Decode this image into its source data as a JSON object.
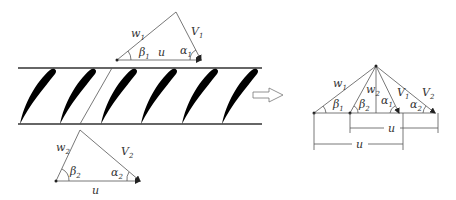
{
  "figure": {
    "type": "turbine blade cascade with velocity triangles",
    "colors": {
      "line": "#333333",
      "blade": "#000000",
      "background": "#ffffff"
    }
  },
  "inlet_triangle": {
    "labels": {
      "relative_velocity": {
        "base": "w",
        "sub": "1"
      },
      "absolute_velocity": {
        "base": "V",
        "sub": "1"
      },
      "blade_speed": "u",
      "angle_relative": {
        "base": "β",
        "sub": "1"
      },
      "angle_absolute": {
        "base": "α",
        "sub": "1"
      }
    }
  },
  "cascade": {
    "blade_count": 6
  },
  "outlet_triangle": {
    "labels": {
      "relative_velocity": {
        "base": "w",
        "sub": "2"
      },
      "absolute_velocity": {
        "base": "V",
        "sub": "2"
      },
      "blade_speed": "u",
      "angle_relative": {
        "base": "β",
        "sub": "2"
      },
      "angle_absolute": {
        "base": "α",
        "sub": "2"
      }
    }
  },
  "combined_diagram": {
    "labels": {
      "w1": {
        "base": "w",
        "sub": "1"
      },
      "w2": {
        "base": "w",
        "sub": "2"
      },
      "V1": {
        "base": "V",
        "sub": "1"
      },
      "V2": {
        "base": "V",
        "sub": "2"
      },
      "beta1": {
        "base": "β",
        "sub": "1"
      },
      "beta2": {
        "base": "β",
        "sub": "2"
      },
      "alpha1": {
        "base": "α",
        "sub": "1"
      },
      "alpha2": {
        "base": "α",
        "sub": "2"
      },
      "u_upper": "u",
      "u_lower": "u"
    }
  }
}
